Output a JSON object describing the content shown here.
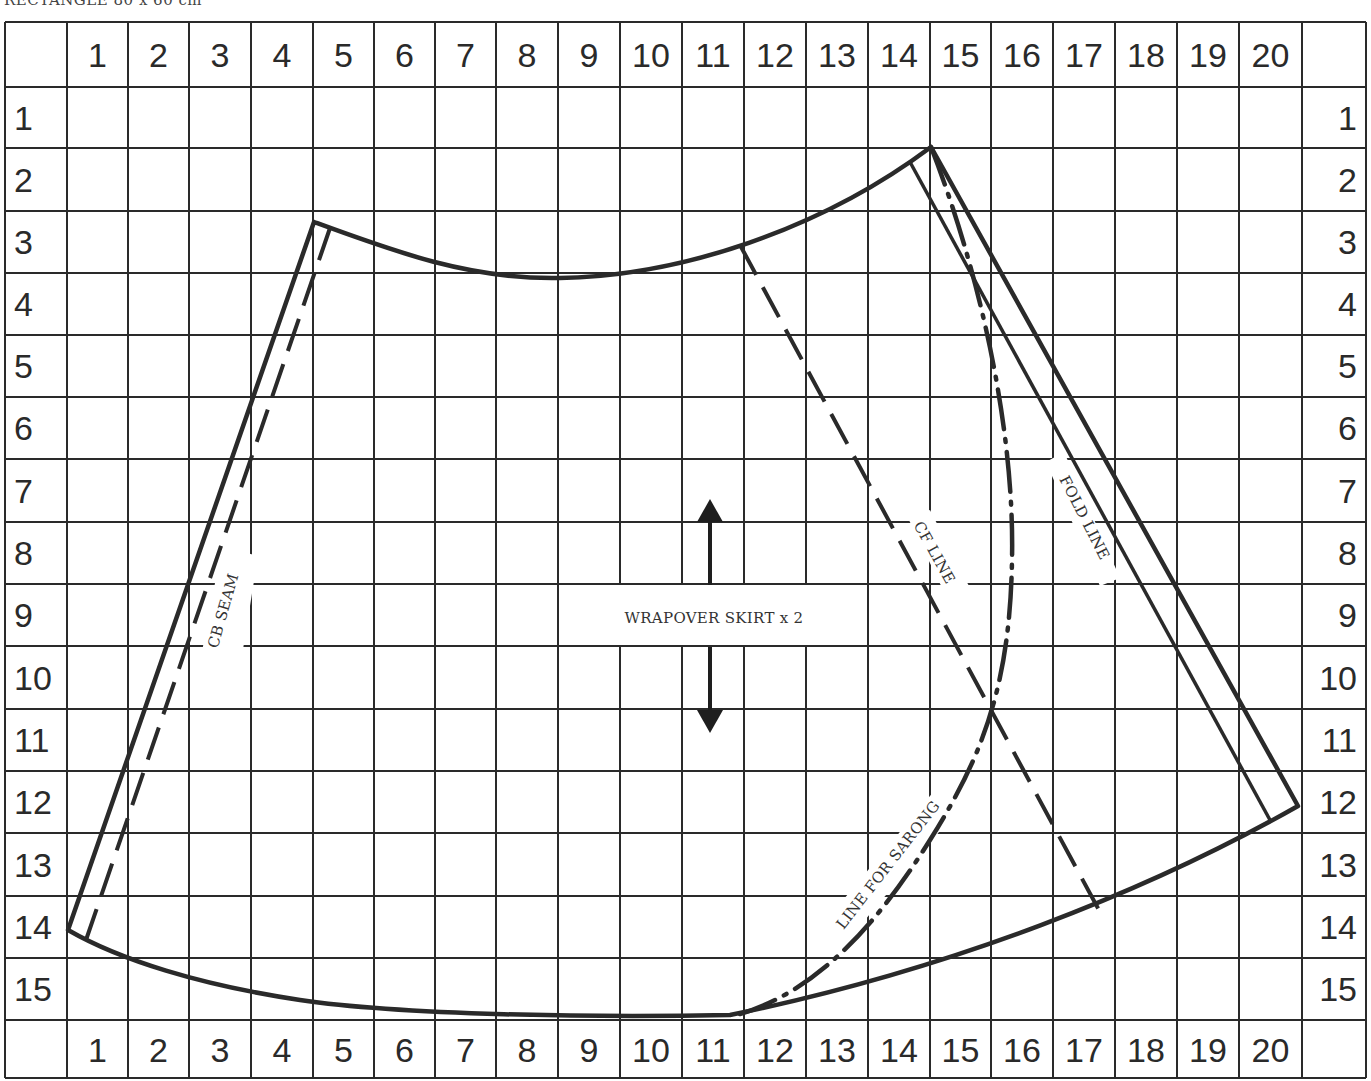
{
  "caption": "RECTANGLE 80 x 60 cm",
  "grid": {
    "columns": [
      "1",
      "2",
      "3",
      "4",
      "5",
      "6",
      "7",
      "8",
      "9",
      "10",
      "11",
      "12",
      "13",
      "14",
      "15",
      "16",
      "17",
      "18",
      "19",
      "20"
    ],
    "rows": [
      "1",
      "2",
      "3",
      "4",
      "5",
      "6",
      "7",
      "8",
      "9",
      "10",
      "11",
      "12",
      "13",
      "14",
      "15"
    ],
    "line_color": "#2a2a2a",
    "background": "#ffffff"
  },
  "labels": {
    "piece_name": "WRAPOVER SKIRT x 2",
    "cb_seam": "CB SEAM",
    "cf_line": "CF LINE",
    "fold_line": "FOLD LINE",
    "sarong_line": "LINE FOR SARONG"
  },
  "pattern": {
    "outline_style": "solid",
    "cb_seam_style": "dashed",
    "cf_line_style": "dashed",
    "fold_line_style": "solid",
    "sarong_line_style": "dash-dot",
    "grainline": "double-headed vertical arrow"
  }
}
